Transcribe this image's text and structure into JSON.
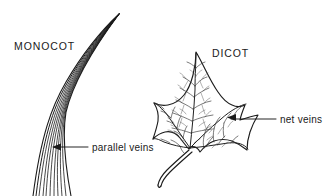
{
  "figure": {
    "background_color": "#ffffff",
    "ink_color": "#1a1a1a",
    "width": 330,
    "height": 196
  },
  "labels": {
    "monocot": "MONOCOT",
    "dicot": "DICOT",
    "parallel_veins": "parallel veins",
    "net_veins": "net veins"
  },
  "specimens": [
    {
      "name": "monocot-grass-blade",
      "common_label": "MONOCOT",
      "venation": "parallel veins",
      "description": "Long tapering grass blade curving up to a sharp tip, drawn as a band of parallel longitudinal lines",
      "vein_line_count": 11
    },
    {
      "name": "dicot-ivy-leaf",
      "common_label": "DICOT",
      "venation": "net veins",
      "description": "Five-lobed ivy-like leaf with a petiole, showing a branching reticulate vein network radiating from the petiole junction",
      "lobe_count": 5
    }
  ],
  "annotations": [
    {
      "name": "parallel-veins-annotation",
      "text": "parallel veins",
      "arrow_direction": "left",
      "points_at": "monocot-grass-blade"
    },
    {
      "name": "net-veins-annotation",
      "text": "net veins",
      "arrow_direction": "left",
      "points_at": "dicot-ivy-leaf"
    }
  ]
}
